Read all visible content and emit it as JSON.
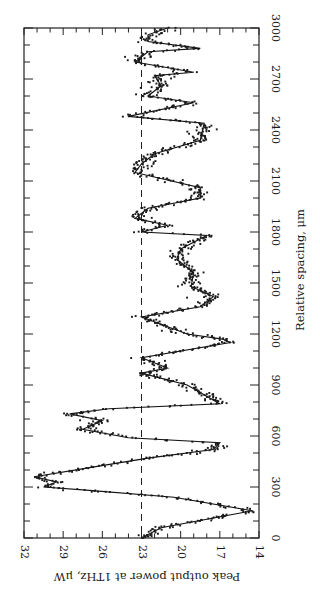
{
  "chart_data": {
    "type": "scatter",
    "orientation": "rotated-90-clockwise",
    "title": "",
    "xlabel": "Relative spacing, μm",
    "ylabel": "Peak output power at 1THz, μW",
    "xlim": [
      0,
      3000
    ],
    "ylim": [
      14,
      32
    ],
    "x_major_ticks": [
      0,
      300,
      600,
      900,
      1200,
      1500,
      1800,
      2100,
      2400,
      2700,
      3000
    ],
    "x_tick_labels": [
      "0",
      "300",
      "600",
      "900",
      "1200",
      "1500",
      "1800",
      "2100",
      "2400",
      "2700",
      "3000"
    ],
    "x_minor_step": 100,
    "y_major_ticks": [
      14,
      17,
      20,
      23,
      26,
      29,
      32
    ],
    "y_tick_labels": [
      "14",
      "17",
      "20",
      "23",
      "26",
      "29",
      "32"
    ],
    "y_minor_step": 1,
    "grid": false,
    "reference_line": {
      "y": 23,
      "style": "dashed"
    },
    "series": [
      {
        "name": "fit",
        "kind": "line",
        "x": [
          0,
          60,
          160,
          240,
          280,
          300,
          330,
          360,
          420,
          470,
          520,
          560,
          590,
          640,
          690,
          730,
          760,
          790,
          900,
          970,
          1000,
          1060,
          1150,
          1170,
          1200,
          1300,
          1360,
          1420,
          1480,
          1560,
          1640,
          1700,
          1780,
          1800,
          1840,
          1880,
          1940,
          2000,
          2060,
          2150,
          2200,
          2260,
          2340,
          2440,
          2480,
          2560,
          2600,
          2660,
          2720,
          2740,
          2800,
          2860,
          2880,
          2920,
          2960,
          3000
        ],
        "y": [
          23,
          21.5,
          14.5,
          20.5,
          27,
          30.5,
          29.5,
          31.2,
          26.5,
          22.5,
          17.5,
          17.0,
          24.0,
          27.5,
          26.0,
          28.5,
          25.5,
          17.0,
          19.5,
          23.0,
          21.0,
          23.0,
          16.2,
          16.8,
          19.5,
          23.0,
          18.5,
          17.5,
          19.2,
          19.0,
          20.3,
          20.0,
          18.0,
          23.0,
          21.0,
          23.5,
          22.5,
          18.5,
          18.5,
          23.5,
          23.0,
          22.0,
          18.5,
          18.2,
          24.0,
          19.0,
          22.5,
          21.5,
          22.0,
          19.0,
          23.5,
          22.5,
          18.5,
          22.5,
          22.5,
          21.0
        ]
      },
      {
        "name": "measurements",
        "kind": "points",
        "description": "dense scatter of measured points distributed around the fit line",
        "scatter_spread_uW": 0.9
      }
    ]
  }
}
